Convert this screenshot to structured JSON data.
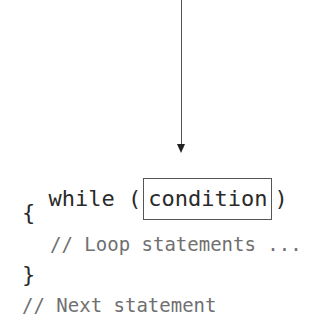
{
  "diagram": {
    "arrow": {
      "direction": "down",
      "target": "condition"
    },
    "lines": {
      "while_keyword": "while",
      "open_paren": "(",
      "condition": "condition",
      "close_paren": ")",
      "open_brace": "{",
      "loop_comment": "// Loop statements ...",
      "close_brace": "}",
      "next_comment": "// Next statement"
    }
  }
}
